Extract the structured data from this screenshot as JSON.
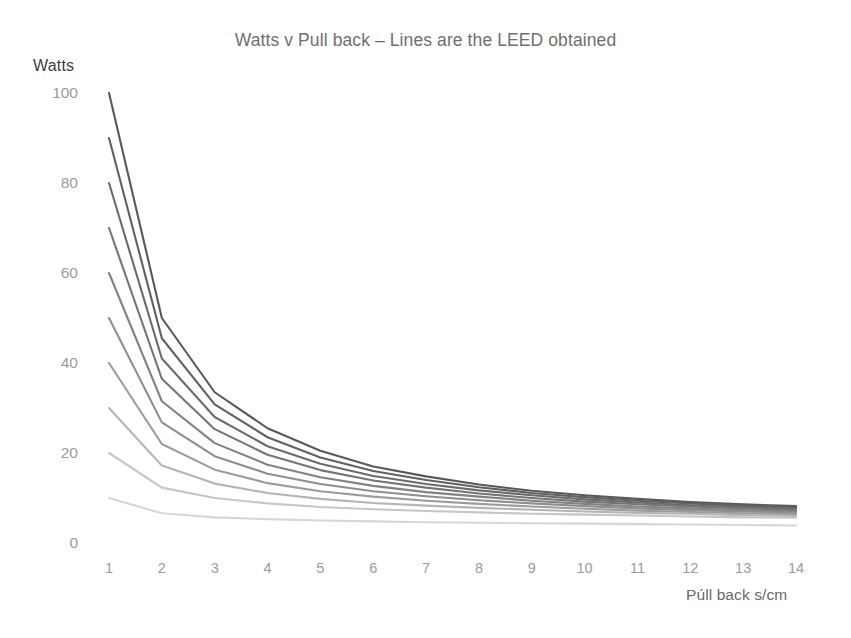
{
  "chart_data": {
    "type": "line",
    "title": "Watts v Pull back – Lines are the LEED obtained",
    "xlabel": "Púll back s/cm",
    "ylabel": "Watts",
    "grid": false,
    "legend": "none",
    "x": [
      1,
      2,
      3,
      4,
      5,
      6,
      7,
      8,
      9,
      10,
      11,
      12,
      13,
      14
    ],
    "xlim": [
      1,
      14
    ],
    "ylim": [
      0,
      100
    ],
    "x_ticks": [
      "1",
      "2",
      "3",
      "4",
      "5",
      "6",
      "7",
      "8",
      "9",
      "10",
      "11",
      "12",
      "13",
      "14"
    ],
    "y_ticks": [
      "0",
      "20",
      "40",
      "60",
      "80",
      "100"
    ],
    "y_tick_values": [
      0,
      20,
      40,
      60,
      80,
      100
    ],
    "annotation": "Each line is one LEED value obtained; darker lines correspond to higher starting Watts.",
    "series": [
      {
        "name": "100",
        "color": "#595959",
        "values": [
          100,
          50,
          33.5,
          25.5,
          20.5,
          17.0,
          14.8,
          13.0,
          11.6,
          10.6,
          9.8,
          9.1,
          8.6,
          8.2
        ]
      },
      {
        "name": "90",
        "color": "#616161",
        "values": [
          90,
          45.5,
          30.8,
          23.5,
          19.0,
          16.0,
          14.0,
          12.4,
          11.1,
          10.2,
          9.4,
          8.8,
          8.3,
          7.9
        ]
      },
      {
        "name": "80",
        "color": "#6b6b6b",
        "values": [
          80,
          41.0,
          28.0,
          21.5,
          17.6,
          14.9,
          13.1,
          11.7,
          10.6,
          9.7,
          9.0,
          8.4,
          8.0,
          7.6
        ]
      },
      {
        "name": "70",
        "color": "#757575",
        "values": [
          70,
          36.5,
          25.3,
          19.6,
          16.2,
          13.9,
          12.3,
          11.0,
          10.0,
          9.2,
          8.6,
          8.1,
          7.7,
          7.3
        ]
      },
      {
        "name": "60",
        "color": "#828282",
        "values": [
          60,
          31.5,
          22.2,
          17.4,
          14.6,
          12.7,
          11.3,
          10.3,
          9.4,
          8.7,
          8.1,
          7.7,
          7.3,
          7.0
        ]
      },
      {
        "name": "50",
        "color": "#8e8e8e",
        "values": [
          50,
          26.8,
          19.3,
          15.4,
          13.1,
          11.5,
          10.4,
          9.5,
          8.8,
          8.2,
          7.7,
          7.3,
          7.0,
          6.7
        ]
      },
      {
        "name": "40",
        "color": "#9c9c9c",
        "values": [
          40,
          22.0,
          16.3,
          13.3,
          11.5,
          10.3,
          9.4,
          8.7,
          8.1,
          7.6,
          7.2,
          6.9,
          6.6,
          6.4
        ]
      },
      {
        "name": "30",
        "color": "#b4b4b4",
        "values": [
          30,
          17.2,
          13.2,
          11.1,
          9.8,
          8.9,
          8.3,
          7.8,
          7.4,
          7.0,
          6.7,
          6.5,
          6.2,
          6.0
        ]
      },
      {
        "name": "20",
        "color": "#c6c6c6",
        "values": [
          20,
          12.3,
          10.0,
          8.8,
          8.0,
          7.5,
          7.1,
          6.8,
          6.5,
          6.3,
          6.1,
          5.9,
          5.7,
          5.6
        ]
      },
      {
        "name": "10",
        "color": "#d6d6d6",
        "values": [
          10,
          6.6,
          5.7,
          5.3,
          5.0,
          4.8,
          4.6,
          4.5,
          4.4,
          4.3,
          4.2,
          4.1,
          4.0,
          3.9
        ]
      }
    ]
  }
}
